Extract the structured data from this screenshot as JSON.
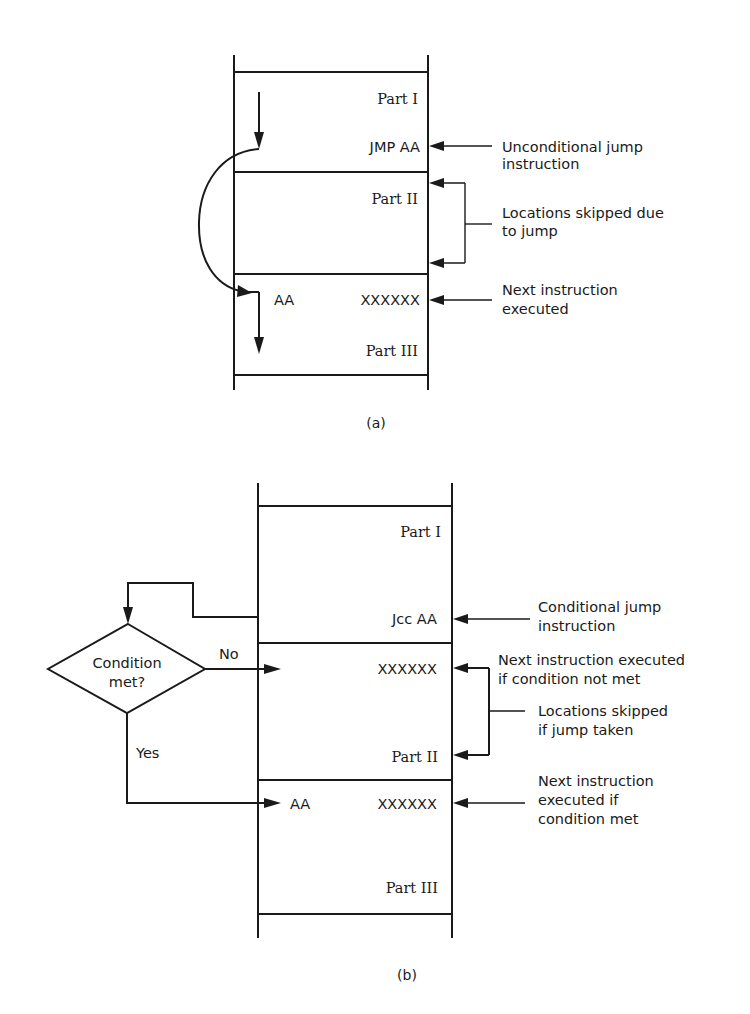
{
  "diagram_a": {
    "caption": "(a)",
    "memory": {
      "part1": "Part I",
      "jmp": "JMP AA",
      "part2": "Part II",
      "label_aa": "AA",
      "label_x": "XXXXXX",
      "part3": "Part III"
    },
    "annotations": {
      "uncond_line1": "Unconditional jump",
      "uncond_line2": "instruction",
      "skipped_line1": "Locations skipped due",
      "skipped_line2": "to jump",
      "next_line1": "Next instruction",
      "next_line2": "executed"
    }
  },
  "diagram_b": {
    "caption": "(b)",
    "memory": {
      "part1": "Part I",
      "jcc": "Jcc AA",
      "x_not_met": "XXXXXX",
      "part2": "Part II",
      "label_aa": "AA",
      "label_x": "XXXXXX",
      "part3": "Part III"
    },
    "decision": {
      "line1": "Condition",
      "line2": "met?",
      "no": "No",
      "yes": "Yes"
    },
    "annotations": {
      "cond_line1": "Conditional jump",
      "cond_line2": "instruction",
      "next_not_met_line1": "Next instruction executed",
      "next_not_met_line2": "if condition not met",
      "skipped_line1": "Locations skipped",
      "skipped_line2": "if jump taken",
      "next_met_line1": "Next instruction",
      "next_met_line2": "executed if",
      "next_met_line3": "condition met"
    }
  }
}
